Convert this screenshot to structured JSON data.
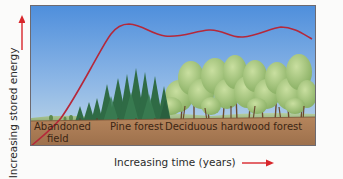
{
  "figure": {
    "y_axis_label": "Increasing stored energy",
    "x_axis_label": "Increasing time (years)",
    "stages": [
      {
        "label": "Abandoned",
        "label_line2": "field"
      },
      {
        "label": "Pine forest"
      },
      {
        "label": "Deciduous hardwood forest"
      }
    ],
    "colors": {
      "sky_top": "#4f8fdc",
      "sky_bottom": "#bfd6e6",
      "soil": "#a87a55",
      "curve": "#b5283a",
      "arrow": "#d8262b",
      "pine": "#2f6b45",
      "deciduous": "#9cc27a",
      "frame": "#6d6a70"
    }
  }
}
